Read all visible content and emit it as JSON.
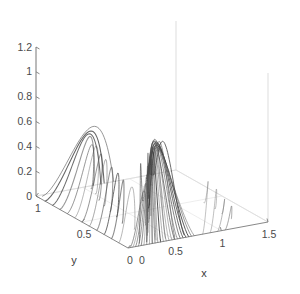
{
  "figure": {
    "background_color": "#ffffff",
    "curve_color": "#606060",
    "axis_color": "#7a7a7a",
    "faint_axis_color": "#cfcfcf"
  },
  "axes": {
    "x": {
      "title": "x",
      "ticks": [
        "0",
        "0.5",
        "1",
        "1.5"
      ],
      "tick_values": [
        0,
        0.5,
        1,
        1.5
      ],
      "range": [
        0,
        1.5
      ]
    },
    "y": {
      "title": "y",
      "ticks": [
        "1",
        "0.5",
        "0"
      ],
      "tick_values": [
        1,
        0.5,
        0
      ],
      "range": [
        0,
        1
      ]
    },
    "z": {
      "title": "",
      "ticks": [
        "0",
        "0.2",
        "0.4",
        "0.6",
        "0.8",
        "1",
        "1.2"
      ],
      "tick_values": [
        0,
        0.2,
        0.4,
        0.6,
        0.8,
        1,
        1.2
      ],
      "range": [
        0,
        1.2
      ]
    }
  },
  "chart_data": {
    "type": "line",
    "title": "",
    "subtitle": "",
    "xlabel": "x",
    "ylabel": "y",
    "zlabel": "",
    "xlim": [
      0,
      1.5
    ],
    "ylim": [
      0,
      1
    ],
    "zlim": [
      0,
      1.2
    ],
    "grid": false,
    "legend": "none",
    "projection": "3d",
    "xticks": [
      0,
      0.5,
      1,
      1.5
    ],
    "yticks": [
      0,
      0.5,
      1
    ],
    "zticks": [
      0,
      0.2,
      0.4,
      0.6,
      0.8,
      1,
      1.2
    ],
    "n_curves": 46,
    "peak_z": 1.05,
    "peak_x": 0.72,
    "peak_y": 0.5,
    "series": [
      {
        "name": "curve-00",
        "start": [
          0.02,
          0.0,
          0.0
        ],
        "apex": [
          0.3,
          0.06,
          0.82
        ],
        "end": [
          0.33,
          0.12,
          0.0
        ]
      },
      {
        "name": "curve-01",
        "start": [
          0.05,
          0.0,
          0.0
        ],
        "apex": [
          0.34,
          0.1,
          0.86
        ],
        "end": [
          0.38,
          0.17,
          0.0
        ]
      },
      {
        "name": "curve-02",
        "start": [
          0.08,
          0.0,
          0.0
        ],
        "apex": [
          0.38,
          0.14,
          0.9
        ],
        "end": [
          0.43,
          0.22,
          0.0
        ]
      },
      {
        "name": "curve-03",
        "start": [
          0.11,
          0.0,
          0.0
        ],
        "apex": [
          0.42,
          0.18,
          0.93
        ],
        "end": [
          0.48,
          0.27,
          0.0
        ]
      },
      {
        "name": "curve-04",
        "start": [
          0.14,
          0.0,
          0.0
        ],
        "apex": [
          0.46,
          0.22,
          0.96
        ],
        "end": [
          0.53,
          0.32,
          0.0
        ]
      },
      {
        "name": "curve-05",
        "start": [
          0.17,
          0.0,
          0.0
        ],
        "apex": [
          0.5,
          0.26,
          0.98
        ],
        "end": [
          0.58,
          0.37,
          0.0
        ]
      },
      {
        "name": "curve-06",
        "start": [
          0.2,
          0.0,
          0.0
        ],
        "apex": [
          0.54,
          0.3,
          1.0
        ],
        "end": [
          0.63,
          0.42,
          0.0
        ]
      },
      {
        "name": "curve-07",
        "start": [
          0.23,
          0.0,
          0.0
        ],
        "apex": [
          0.58,
          0.34,
          1.02
        ],
        "end": [
          0.68,
          0.47,
          0.0
        ]
      },
      {
        "name": "curve-08",
        "start": [
          0.26,
          0.0,
          0.0
        ],
        "apex": [
          0.62,
          0.38,
          1.03
        ],
        "end": [
          0.73,
          0.52,
          0.0
        ]
      },
      {
        "name": "curve-09",
        "start": [
          0.29,
          0.0,
          0.0
        ],
        "apex": [
          0.66,
          0.42,
          1.04
        ],
        "end": [
          0.78,
          0.57,
          0.0
        ]
      },
      {
        "name": "curve-10",
        "start": [
          0.32,
          0.0,
          0.0
        ],
        "apex": [
          0.7,
          0.46,
          1.05
        ],
        "end": [
          0.83,
          0.62,
          0.0
        ]
      },
      {
        "name": "curve-11",
        "start": [
          0.35,
          0.0,
          0.0
        ],
        "apex": [
          0.74,
          0.5,
          1.05
        ],
        "end": [
          0.88,
          0.67,
          0.0
        ]
      },
      {
        "name": "curve-12",
        "start": [
          0.38,
          0.0,
          0.0
        ],
        "apex": [
          0.78,
          0.54,
          1.04
        ],
        "end": [
          0.93,
          0.72,
          0.0
        ]
      },
      {
        "name": "curve-13",
        "start": [
          0.41,
          0.0,
          0.0
        ],
        "apex": [
          0.82,
          0.58,
          1.03
        ],
        "end": [
          0.98,
          0.77,
          0.0
        ]
      },
      {
        "name": "curve-14",
        "start": [
          0.44,
          0.0,
          0.0
        ],
        "apex": [
          0.86,
          0.62,
          1.01
        ],
        "end": [
          1.02,
          0.82,
          0.0
        ]
      },
      {
        "name": "curve-15",
        "start": [
          0.47,
          0.0,
          0.0
        ],
        "apex": [
          0.9,
          0.66,
          0.99
        ],
        "end": [
          1.06,
          0.87,
          0.0
        ]
      },
      {
        "name": "curve-16",
        "start": [
          0.5,
          0.0,
          0.0
        ],
        "apex": [
          0.94,
          0.7,
          0.96
        ],
        "end": [
          1.1,
          0.92,
          0.0
        ]
      },
      {
        "name": "curve-17",
        "start": [
          0.53,
          0.0,
          0.0
        ],
        "apex": [
          0.98,
          0.74,
          0.93
        ],
        "end": [
          1.14,
          0.96,
          0.0
        ]
      },
      {
        "name": "curve-18",
        "start": [
          0.56,
          0.0,
          0.0
        ],
        "apex": [
          1.02,
          0.78,
          0.89
        ],
        "end": [
          1.18,
          1.0,
          0.0
        ]
      },
      {
        "name": "curve-19",
        "start": [
          0.59,
          0.0,
          0.0
        ],
        "apex": [
          1.06,
          0.82,
          0.85
        ],
        "end": [
          1.2,
          1.0,
          0.0
        ]
      },
      {
        "name": "curve-20",
        "start": [
          0.62,
          0.0,
          0.0
        ],
        "apex": [
          1.1,
          0.86,
          0.8
        ],
        "end": [
          1.22,
          1.0,
          0.0
        ]
      },
      {
        "name": "curve-21",
        "start": [
          0.65,
          0.0,
          0.0
        ],
        "apex": [
          1.13,
          0.9,
          0.74
        ],
        "end": [
          1.24,
          1.0,
          0.0
        ]
      },
      {
        "name": "curve-22",
        "start": [
          0.68,
          0.0,
          0.0
        ],
        "apex": [
          1.16,
          0.94,
          0.68
        ],
        "end": [
          1.25,
          1.0,
          0.0
        ]
      },
      {
        "name": "curve-23",
        "start": [
          0.71,
          0.0,
          0.0
        ],
        "apex": [
          1.18,
          0.97,
          0.6
        ],
        "end": [
          1.26,
          1.0,
          0.0
        ]
      },
      {
        "name": "curve-24",
        "start": [
          0.0,
          0.1,
          0.0
        ],
        "apex": [
          0.28,
          0.18,
          0.78
        ],
        "end": [
          0.3,
          0.26,
          0.0
        ]
      },
      {
        "name": "curve-25",
        "start": [
          0.0,
          0.18,
          0.0
        ],
        "apex": [
          0.3,
          0.28,
          0.8
        ],
        "end": [
          0.32,
          0.38,
          0.0
        ]
      },
      {
        "name": "curve-26",
        "start": [
          0.0,
          0.26,
          0.0
        ],
        "apex": [
          0.33,
          0.37,
          0.82
        ],
        "end": [
          0.35,
          0.48,
          0.0
        ]
      },
      {
        "name": "curve-27",
        "start": [
          0.0,
          0.34,
          0.0
        ],
        "apex": [
          0.36,
          0.46,
          0.84
        ],
        "end": [
          0.38,
          0.58,
          0.0
        ]
      },
      {
        "name": "curve-28",
        "start": [
          0.0,
          0.42,
          0.0
        ],
        "apex": [
          0.39,
          0.55,
          0.86
        ],
        "end": [
          0.42,
          0.68,
          0.0
        ]
      },
      {
        "name": "curve-29",
        "start": [
          0.0,
          0.5,
          0.0
        ],
        "apex": [
          0.43,
          0.63,
          0.88
        ],
        "end": [
          0.46,
          0.78,
          0.0
        ]
      },
      {
        "name": "curve-30",
        "start": [
          0.0,
          0.58,
          0.0
        ],
        "apex": [
          0.47,
          0.71,
          0.9
        ],
        "end": [
          0.5,
          0.87,
          0.0
        ]
      },
      {
        "name": "curve-31",
        "start": [
          0.0,
          0.66,
          0.0
        ],
        "apex": [
          0.52,
          0.79,
          0.92
        ],
        "end": [
          0.55,
          0.95,
          0.0
        ]
      },
      {
        "name": "curve-32",
        "start": [
          0.0,
          0.74,
          0.0
        ],
        "apex": [
          0.57,
          0.86,
          0.94
        ],
        "end": [
          0.61,
          1.0,
          0.0
        ]
      },
      {
        "name": "curve-33",
        "start": [
          0.0,
          0.82,
          0.0
        ],
        "apex": [
          0.63,
          0.92,
          0.95
        ],
        "end": [
          0.68,
          1.0,
          0.0
        ]
      },
      {
        "name": "curve-34",
        "start": [
          0.0,
          0.9,
          0.0
        ],
        "apex": [
          0.69,
          0.96,
          0.96
        ],
        "end": [
          0.75,
          1.0,
          0.0
        ]
      },
      {
        "name": "curve-35",
        "start": [
          0.05,
          0.98,
          0.0
        ],
        "apex": [
          0.76,
          1.0,
          0.96
        ],
        "end": [
          0.83,
          1.0,
          0.0
        ]
      },
      {
        "name": "curve-36",
        "start": [
          0.8,
          0.0,
          0.0
        ],
        "apex": [
          1.19,
          0.3,
          0.5
        ],
        "end": [
          1.26,
          0.45,
          0.0
        ]
      },
      {
        "name": "curve-37",
        "start": [
          0.88,
          0.0,
          0.0
        ],
        "apex": [
          1.21,
          0.22,
          0.42
        ],
        "end": [
          1.26,
          0.34,
          0.0
        ]
      },
      {
        "name": "curve-38",
        "start": [
          0.96,
          0.0,
          0.0
        ],
        "apex": [
          1.23,
          0.15,
          0.34
        ],
        "end": [
          1.26,
          0.24,
          0.0
        ]
      },
      {
        "name": "curve-39",
        "start": [
          1.04,
          0.0,
          0.0
        ],
        "apex": [
          1.24,
          0.09,
          0.26
        ],
        "end": [
          1.26,
          0.15,
          0.0
        ]
      },
      {
        "name": "curve-40",
        "start": [
          0.16,
          0.04,
          0.0
        ],
        "apex": [
          0.48,
          0.33,
          0.94
        ],
        "end": [
          0.8,
          0.66,
          0.0
        ]
      },
      {
        "name": "curve-41",
        "start": [
          0.24,
          0.04,
          0.0
        ],
        "apex": [
          0.6,
          0.4,
          1.0
        ],
        "end": [
          0.96,
          0.74,
          0.0
        ]
      },
      {
        "name": "curve-42",
        "start": [
          0.34,
          0.04,
          0.0
        ],
        "apex": [
          0.72,
          0.48,
          1.04
        ],
        "end": [
          1.1,
          0.86,
          0.0
        ]
      },
      {
        "name": "curve-43",
        "start": [
          0.44,
          0.04,
          0.0
        ],
        "apex": [
          0.84,
          0.56,
          1.02
        ],
        "end": [
          1.18,
          0.94,
          0.0
        ]
      },
      {
        "name": "curve-44",
        "start": [
          0.54,
          0.04,
          0.0
        ],
        "apex": [
          0.96,
          0.64,
          0.96
        ],
        "end": [
          1.24,
          0.99,
          0.0
        ]
      },
      {
        "name": "curve-45",
        "start": [
          0.64,
          0.04,
          0.0
        ],
        "apex": [
          1.06,
          0.72,
          0.88
        ],
        "end": [
          1.26,
          1.0,
          0.0
        ]
      }
    ]
  }
}
